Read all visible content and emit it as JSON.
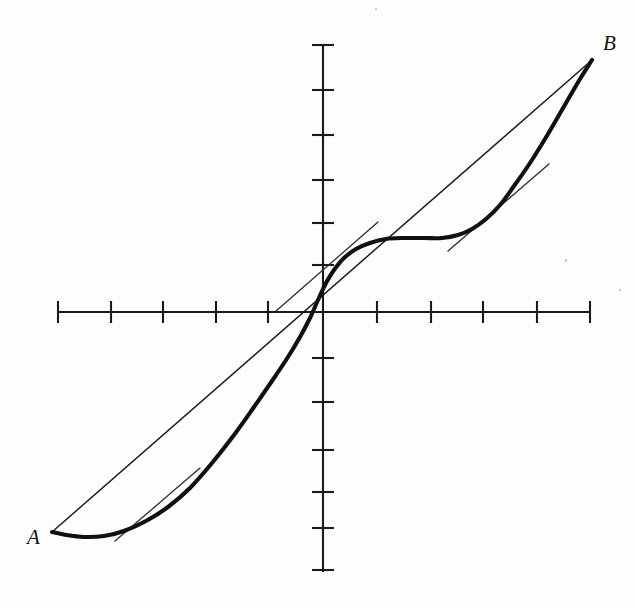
{
  "figure": {
    "kind": "cartesian-plot",
    "background_color": "#fdfdfc",
    "ink_color": "#101010",
    "labels": {
      "point_a": "A",
      "point_b": "B"
    }
  },
  "axes": {
    "origin": {
      "x": 323,
      "y": 312
    },
    "x_axis": {
      "x_start": 58,
      "x_end": 590,
      "y": 312,
      "color": "#1a1a1a"
    },
    "y_axis": {
      "y_start": 45,
      "y_end": 572,
      "x": 323,
      "color": "#1a1a1a"
    },
    "x_tick_positions": [
      58,
      111,
      163,
      216,
      268,
      377,
      431,
      483,
      537,
      590
    ],
    "y_tick_positions": [
      45,
      90,
      135,
      180,
      223,
      265,
      358,
      402,
      450,
      492,
      528,
      570
    ],
    "tick_half_length_x": 11,
    "tick_half_length_y": 11
  },
  "chart_data": {
    "type": "line",
    "title": "",
    "xlabel": "",
    "ylabel": "",
    "grid": false,
    "legend": null,
    "annotations": [
      {
        "text": "A",
        "x": 52,
        "y": 532,
        "role": "endpoint-label"
      },
      {
        "text": "B",
        "x": 592,
        "y": 60,
        "role": "endpoint-label"
      }
    ],
    "series": [
      {
        "name": "curve",
        "style": "thick-solid",
        "points": [
          [
            52,
            532
          ],
          [
            66,
            535
          ],
          [
            84,
            537
          ],
          [
            104,
            536
          ],
          [
            124,
            531
          ],
          [
            146,
            521
          ],
          [
            168,
            507
          ],
          [
            190,
            488
          ],
          [
            212,
            463
          ],
          [
            234,
            435
          ],
          [
            254,
            407
          ],
          [
            272,
            381
          ],
          [
            288,
            357
          ],
          [
            300,
            337
          ],
          [
            310,
            318
          ],
          [
            318,
            300
          ],
          [
            326,
            283
          ],
          [
            334,
            270
          ],
          [
            344,
            258
          ],
          [
            356,
            249
          ],
          [
            370,
            243
          ],
          [
            386,
            239
          ],
          [
            404,
            238
          ],
          [
            424,
            238
          ],
          [
            442,
            238
          ],
          [
            458,
            235
          ],
          [
            472,
            229
          ],
          [
            486,
            219
          ],
          [
            500,
            205
          ],
          [
            514,
            186
          ],
          [
            530,
            163
          ],
          [
            548,
            134
          ],
          [
            566,
            103
          ],
          [
            580,
            79
          ],
          [
            592,
            60
          ]
        ]
      },
      {
        "name": "secant-chord-AB",
        "style": "thin-solid",
        "points": [
          [
            52,
            532
          ],
          [
            592,
            60
          ]
        ]
      },
      {
        "name": "tangent-left",
        "style": "thin-solid",
        "points": [
          [
            115,
            541
          ],
          [
            200,
            468
          ]
        ]
      },
      {
        "name": "tangent-middle",
        "style": "thin-solid",
        "points": [
          [
            276,
            311
          ],
          [
            378,
            222
          ]
        ]
      },
      {
        "name": "tangent-right",
        "style": "thin-solid",
        "points": [
          [
            448,
            251
          ],
          [
            549,
            164
          ]
        ]
      }
    ]
  }
}
